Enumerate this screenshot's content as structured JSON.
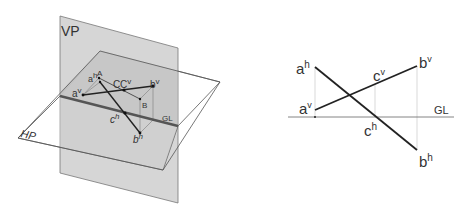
{
  "left_diagram": {
    "title": "Pictorial view of line AB with VP and HP",
    "planes": {
      "vp_label": "VP",
      "hp_label": "HP",
      "gl_label": "GL"
    },
    "points": {
      "A": "A",
      "B": "B",
      "C": "C",
      "a_v": {
        "base": "a",
        "sup": "v"
      },
      "b_v": {
        "base": "b",
        "sup": "v"
      },
      "c_v": {
        "base": "C",
        "sup": "v"
      },
      "a_h": {
        "base": "a",
        "sup": "h"
      },
      "b_h": {
        "base": "b",
        "sup": "h"
      },
      "c_h": {
        "base": "c",
        "sup": "h"
      }
    }
  },
  "right_diagram": {
    "title": "Orthographic projections of line AB",
    "gl_label": "GL",
    "points": {
      "a_h": {
        "base": "a",
        "sup": "h"
      },
      "a_v": {
        "base": "a",
        "sup": "v"
      },
      "b_v": {
        "base": "b",
        "sup": "v"
      },
      "b_h": {
        "base": "b",
        "sup": "h"
      },
      "c_v": {
        "base": "c",
        "sup": "v"
      },
      "c_h": {
        "base": "c",
        "sup": "h"
      }
    }
  },
  "colors": {
    "vp_fill": "#cfcfcf",
    "hp_fill": "#ffffff",
    "overlap_fill": "#bdbdbd",
    "line": "#222222",
    "projector": "#bbbbbb",
    "gl": "#555555",
    "text": "#333333"
  }
}
